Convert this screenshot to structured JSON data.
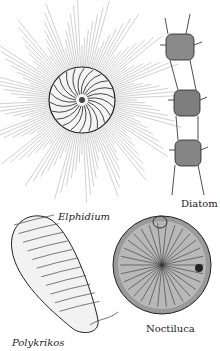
{
  "figure": {
    "labels": {
      "elphidium": "Elphidium",
      "diatom": "Diatom",
      "polykrikos": "Polykrikos",
      "noctiluca": "Noctiluca"
    }
  }
}
